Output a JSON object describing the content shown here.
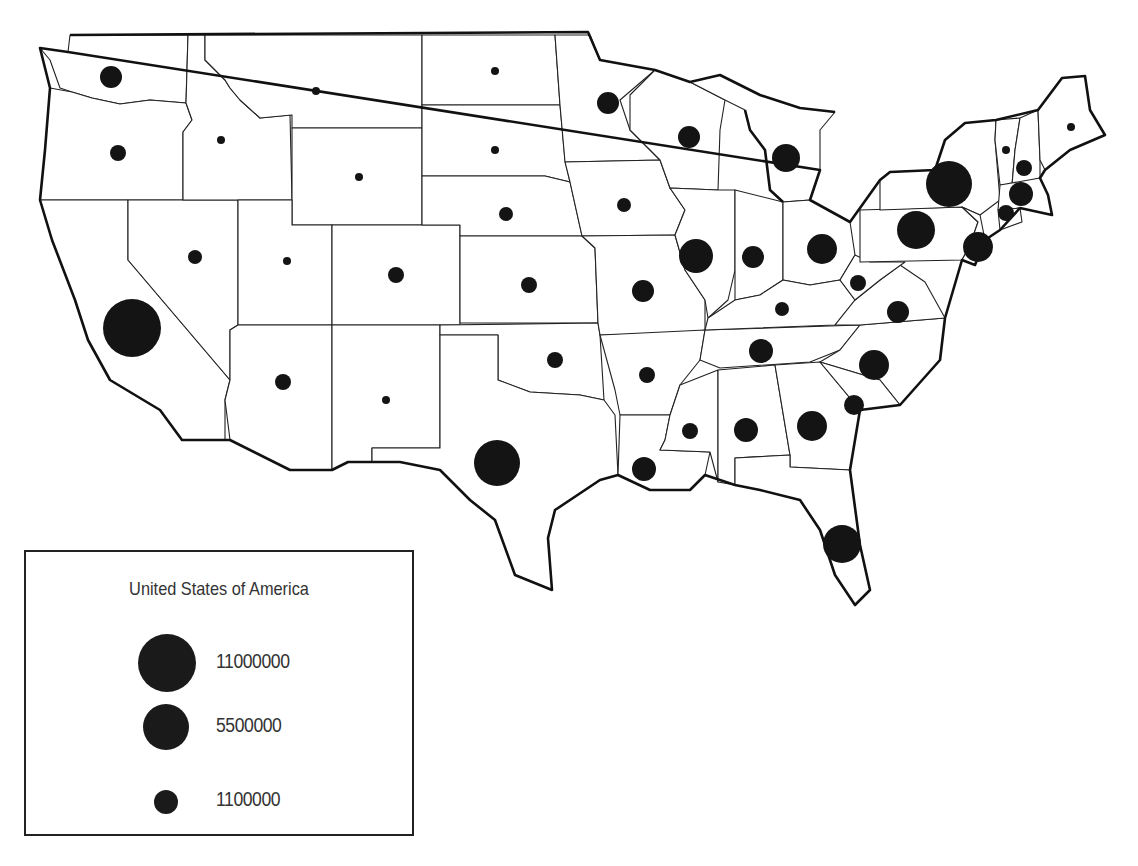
{
  "map": {
    "type": "proportional-symbol",
    "region": "Contiguous United States",
    "symbol_color": "#141414",
    "boundary_color": "#222222",
    "states": [
      {
        "abbr": "WA",
        "cx": 111,
        "cy": 77,
        "r": 11
      },
      {
        "abbr": "OR",
        "cx": 118,
        "cy": 153,
        "r": 8
      },
      {
        "abbr": "ID",
        "cx": 221,
        "cy": 140,
        "r": 4
      },
      {
        "abbr": "MT",
        "cx": 316,
        "cy": 91,
        "r": 4
      },
      {
        "abbr": "WY",
        "cx": 359,
        "cy": 177,
        "r": 4
      },
      {
        "abbr": "ND",
        "cx": 495,
        "cy": 71,
        "r": 4
      },
      {
        "abbr": "SD",
        "cx": 495,
        "cy": 150,
        "r": 4
      },
      {
        "abbr": "NE",
        "cx": 506,
        "cy": 214,
        "r": 7
      },
      {
        "abbr": "MN",
        "cx": 608,
        "cy": 103,
        "r": 11
      },
      {
        "abbr": "WI",
        "cx": 689,
        "cy": 137,
        "r": 11
      },
      {
        "abbr": "MI",
        "cx": 786,
        "cy": 158,
        "r": 14
      },
      {
        "abbr": "IA",
        "cx": 624,
        "cy": 205,
        "r": 7
      },
      {
        "abbr": "IL",
        "cx": 696,
        "cy": 256,
        "r": 17
      },
      {
        "abbr": "IN",
        "cx": 753,
        "cy": 257,
        "r": 11
      },
      {
        "abbr": "OH",
        "cx": 822,
        "cy": 249,
        "r": 15
      },
      {
        "abbr": "CA",
        "cx": 132,
        "cy": 328,
        "r": 29
      },
      {
        "abbr": "NV",
        "cx": 195,
        "cy": 257,
        "r": 7
      },
      {
        "abbr": "UT",
        "cx": 287,
        "cy": 261,
        "r": 4
      },
      {
        "abbr": "CO",
        "cx": 396,
        "cy": 275,
        "r": 8
      },
      {
        "abbr": "KS",
        "cx": 529,
        "cy": 285,
        "r": 8
      },
      {
        "abbr": "MO",
        "cx": 643,
        "cy": 291,
        "r": 11
      },
      {
        "abbr": "KY",
        "cx": 782,
        "cy": 309,
        "r": 7
      },
      {
        "abbr": "WV",
        "cx": 858,
        "cy": 283,
        "r": 8
      },
      {
        "abbr": "VA",
        "cx": 898,
        "cy": 312,
        "r": 11
      },
      {
        "abbr": "AZ",
        "cx": 283,
        "cy": 382,
        "r": 8
      },
      {
        "abbr": "NM",
        "cx": 386,
        "cy": 400,
        "r": 4
      },
      {
        "abbr": "OK",
        "cx": 555,
        "cy": 360,
        "r": 8
      },
      {
        "abbr": "AR",
        "cx": 647,
        "cy": 375,
        "r": 8
      },
      {
        "abbr": "TN",
        "cx": 761,
        "cy": 351,
        "r": 12
      },
      {
        "abbr": "NC",
        "cx": 874,
        "cy": 365,
        "r": 15
      },
      {
        "abbr": "SC",
        "cx": 854,
        "cy": 405,
        "r": 10
      },
      {
        "abbr": "TX",
        "cx": 497,
        "cy": 463,
        "r": 23
      },
      {
        "abbr": "LA",
        "cx": 644,
        "cy": 469,
        "r": 12
      },
      {
        "abbr": "MS",
        "cx": 690,
        "cy": 431,
        "r": 8
      },
      {
        "abbr": "AL",
        "cx": 746,
        "cy": 430,
        "r": 12
      },
      {
        "abbr": "GA",
        "cx": 812,
        "cy": 426,
        "r": 15
      },
      {
        "abbr": "FL",
        "cx": 842,
        "cy": 544,
        "r": 19
      },
      {
        "abbr": "PA",
        "cx": 916,
        "cy": 230,
        "r": 19
      },
      {
        "abbr": "NY",
        "cx": 949,
        "cy": 184,
        "r": 23
      },
      {
        "abbr": "NJ",
        "cx": 978,
        "cy": 247,
        "r": 15
      },
      {
        "abbr": "VT",
        "cx": 1006,
        "cy": 150,
        "r": 4
      },
      {
        "abbr": "NH",
        "cx": 1024,
        "cy": 168,
        "r": 8
      },
      {
        "abbr": "MA",
        "cx": 1021,
        "cy": 194,
        "r": 12
      },
      {
        "abbr": "CT",
        "cx": 1006,
        "cy": 213,
        "r": 8
      },
      {
        "abbr": "ME",
        "cx": 1071,
        "cy": 127,
        "r": 4
      }
    ]
  },
  "legend": {
    "title": "United States of America",
    "items": [
      {
        "label": "11000000",
        "value": 11000000,
        "radius": 29
      },
      {
        "label": "5500000",
        "value": 5500000,
        "radius": 23
      },
      {
        "label": "1100000",
        "value": 1100000,
        "radius": 12
      }
    ]
  }
}
